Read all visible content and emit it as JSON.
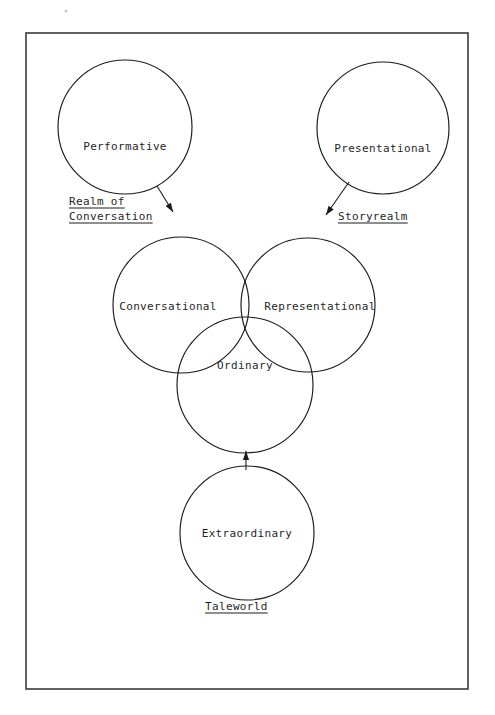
{
  "figure": {
    "kind": "scanned-conceptual-diagram",
    "title_visible": false,
    "background_color": "#ffffff",
    "ink_color": "#1a1a1a",
    "frame": {
      "label": "page-border",
      "x": 26,
      "y": 33,
      "width": 442,
      "height": 656,
      "stroke": "#3a3a3a"
    },
    "nodes": [
      {
        "id": "performative",
        "label": "Performative",
        "cx": 125,
        "cy": 127,
        "r": 67,
        "label_x": 125,
        "label_y": 150
      },
      {
        "id": "presentational",
        "label": "Presentational",
        "cx": 383,
        "cy": 128,
        "r": 66,
        "label_x": 383,
        "label_y": 152
      },
      {
        "id": "conversational",
        "label": "Conversational",
        "cx": 181,
        "cy": 305,
        "r": 68,
        "label_x": 168,
        "label_y": 310
      },
      {
        "id": "representational",
        "label": "Representational",
        "cx": 308,
        "cy": 305,
        "r": 67,
        "label_x": 320,
        "label_y": 310
      },
      {
        "id": "ordinary",
        "label": "Ordinary",
        "cx": 245,
        "cy": 385,
        "r": 68,
        "label_x": 245,
        "label_y": 369
      },
      {
        "id": "extraordinary",
        "label": "Extraordinary",
        "cx": 247,
        "cy": 533,
        "r": 67,
        "label_x": 247,
        "label_y": 537
      }
    ],
    "group_labels": [
      {
        "id": "realm-of-conversation",
        "lines": [
          "Realm of",
          "Conversation"
        ],
        "x": 69,
        "y_first": 205,
        "line_height": 15,
        "underlined": true
      },
      {
        "id": "storyrealm",
        "lines": [
          "Storyrealm"
        ],
        "x": 338,
        "y_first": 220,
        "line_height": 15,
        "underlined": true
      },
      {
        "id": "taleworld",
        "lines": [
          "Taleworld"
        ],
        "x": 205,
        "y_first": 610,
        "line_height": 15,
        "underlined": true
      }
    ],
    "connectors": [
      {
        "id": "performative-to-realm-of-conversation",
        "from": "performative",
        "to": "realm-of-conversation",
        "x1": 157,
        "y1": 186,
        "x2": 173,
        "y2": 212,
        "arrow": "end"
      },
      {
        "id": "presentational-to-storyrealm",
        "from": "presentational",
        "to": "storyrealm",
        "x1": 349,
        "y1": 182,
        "x2": 326,
        "y2": 215,
        "arrow": "end"
      },
      {
        "id": "extraordinary-to-ordinary",
        "from": "extraordinary",
        "to": "ordinary",
        "x1": 246,
        "y1": 470,
        "x2": 246,
        "y2": 451,
        "arrow": "end"
      }
    ]
  }
}
